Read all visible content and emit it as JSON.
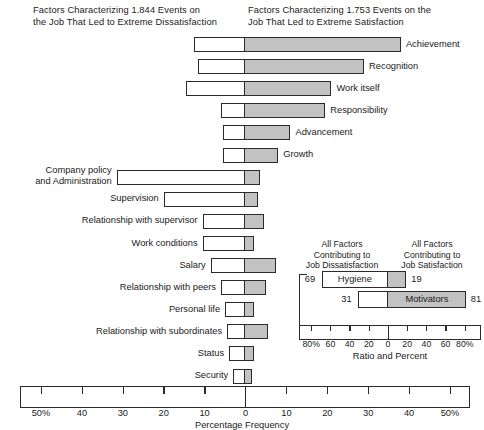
{
  "headers": {
    "left": "Factors Characterizing 1.844 Events on\nthe Job That Led to Extreme Dissatisfaction",
    "right": "Factors Characterizing 1.753 Events on the\nJob That Led to Extreme Satisfaction"
  },
  "axis": {
    "title": "Percentage Frequency",
    "ticks": [
      {
        "label": "50%",
        "value": -50
      },
      {
        "label": "40",
        "value": -40
      },
      {
        "label": "30",
        "value": -30
      },
      {
        "label": "20",
        "value": -20
      },
      {
        "label": "10",
        "value": -10
      },
      {
        "label": "0",
        "value": 0
      },
      {
        "label": "10",
        "value": 10
      },
      {
        "label": "20",
        "value": 20
      },
      {
        "label": "30",
        "value": 30
      },
      {
        "label": "40",
        "value": 40
      },
      {
        "label": "50%",
        "value": 50
      }
    ],
    "min": -55,
    "max": 55
  },
  "inset": {
    "header_left": "All Factors\nContributing to\nJob Dissatisfaction",
    "header_right": "All Factors\nContributing to\nJob Satisfaction",
    "axis_title": "Ratio and Percent",
    "ticks": [
      {
        "label": "80%",
        "value": -80
      },
      {
        "label": "60",
        "value": -60
      },
      {
        "label": "40",
        "value": -40
      },
      {
        "label": "20",
        "value": -20
      },
      {
        "label": "0",
        "value": 0
      },
      {
        "label": "20",
        "value": 20
      },
      {
        "label": "40",
        "value": 40
      },
      {
        "label": "60",
        "value": 60
      },
      {
        "label": "80%",
        "value": 80
      }
    ],
    "rows": [
      {
        "name": "Hygiene",
        "left": 69,
        "right": 19,
        "left_label": "69",
        "right_label": "19",
        "label_side": "left"
      },
      {
        "name": "Motivators",
        "left": 31,
        "right": 81,
        "left_label": "31",
        "right_label": "81",
        "label_side": "right"
      }
    ]
  },
  "colors": {
    "gray_fill": "#c2c2c2",
    "outline": "#2b2b2b",
    "white_fill": "#ffffff",
    "background": "#ffffff"
  },
  "chart_data": {
    "type": "bar",
    "xlabel": "Percentage Frequency",
    "ylabel": "",
    "xlim": [
      -55,
      55
    ],
    "grid": false,
    "legend": [
      "Dissatisfaction (left of zero)",
      "Satisfaction (right of zero)"
    ],
    "note": "Each factor row is a single bar spanning both sides of the zero line; the white segment lies left of zero (dissatisfaction frequency) and the gray segment lies right of zero (satisfaction frequency).",
    "categories": [
      "Achievement",
      "Recognition",
      "Work itself",
      "Responsibility",
      "Advancement",
      "Growth",
      "Company policy and Administration",
      "Supervision",
      "Relationship with supervisor",
      "Work conditions",
      "Salary",
      "Relationship with peers",
      "Personal life",
      "Relationship with subordinates",
      "Status",
      "Security"
    ],
    "series": [
      {
        "name": "Dissatisfaction (%) — white segment, left of zero",
        "values": [
          12.5,
          11.5,
          14.5,
          6.0,
          5.5,
          5.5,
          31.5,
          20.0,
          10.5,
          10.5,
          8.5,
          6.0,
          5.0,
          4.5,
          4.0,
          3.0
        ]
      },
      {
        "name": "Satisfaction (%) — gray segment, right of zero",
        "values": [
          38.0,
          29.0,
          21.0,
          19.5,
          11.0,
          8.0,
          3.5,
          3.0,
          4.5,
          2.0,
          7.5,
          5.0,
          2.0,
          5.5,
          2.0,
          1.5
        ]
      }
    ],
    "inset": {
      "type": "bar",
      "title": "All Factors Contributing to Job Dissatisfaction / Job Satisfaction",
      "xlabel": "Ratio and Percent",
      "xlim": [
        -90,
        90
      ],
      "categories": [
        "Hygiene",
        "Motivators"
      ],
      "series": [
        {
          "name": "Contributing to Job Dissatisfaction (%)",
          "values": [
            69,
            31
          ]
        },
        {
          "name": "Contributing to Job Satisfaction (%)",
          "values": [
            19,
            81
          ]
        }
      ]
    }
  },
  "rows": [
    {
      "label": "Achievement",
      "side": "right",
      "left": 12.5,
      "right": 38.0,
      "label_lines": 1
    },
    {
      "label": "Recognition",
      "side": "right",
      "left": 11.5,
      "right": 29.0,
      "label_lines": 1
    },
    {
      "label": "Work itself",
      "side": "right",
      "left": 14.5,
      "right": 21.0,
      "label_lines": 1
    },
    {
      "label": "Responsibility",
      "side": "right",
      "left": 6.0,
      "right": 19.5,
      "label_lines": 1
    },
    {
      "label": "Advancement",
      "side": "right",
      "left": 5.5,
      "right": 11.0,
      "label_lines": 1
    },
    {
      "label": "Growth",
      "side": "right",
      "left": 5.5,
      "right": 8.0,
      "label_lines": 1
    },
    {
      "label": "Company policy\nand Administration",
      "side": "left",
      "left": 31.5,
      "right": 3.5,
      "label_lines": 2
    },
    {
      "label": "Supervision",
      "side": "left",
      "left": 20.0,
      "right": 3.0,
      "label_lines": 1
    },
    {
      "label": "Relationship with supervisor",
      "side": "left",
      "left": 10.5,
      "right": 4.5,
      "label_lines": 1
    },
    {
      "label": "Work conditions",
      "side": "left",
      "left": 10.5,
      "right": 2.0,
      "label_lines": 1
    },
    {
      "label": "Salary",
      "side": "left",
      "left": 8.5,
      "right": 7.5,
      "label_lines": 1
    },
    {
      "label": "Relationship with peers",
      "side": "left",
      "left": 6.0,
      "right": 5.0,
      "label_lines": 1
    },
    {
      "label": "Personal life",
      "side": "left",
      "left": 5.0,
      "right": 2.0,
      "label_lines": 1
    },
    {
      "label": "Relationship with subordinates",
      "side": "left",
      "left": 4.5,
      "right": 5.5,
      "label_lines": 1
    },
    {
      "label": "Status",
      "side": "left",
      "left": 4.0,
      "right": 2.0,
      "label_lines": 1
    },
    {
      "label": "Security",
      "side": "left",
      "left": 3.0,
      "right": 1.5,
      "label_lines": 1
    }
  ]
}
